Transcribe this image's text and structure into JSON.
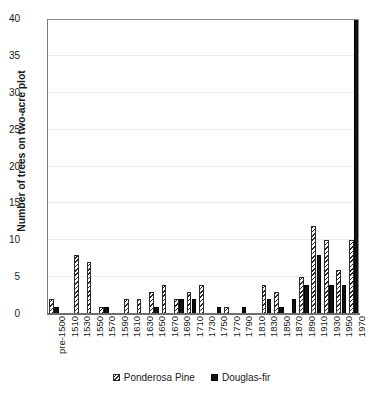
{
  "chart_data": {
    "type": "bar",
    "title": "",
    "xlabel": "",
    "ylabel": "Number of trees on two-acre plot",
    "ylim": [
      0,
      40
    ],
    "yticks": [
      0,
      5,
      10,
      15,
      20,
      25,
      30,
      35,
      40
    ],
    "grid": true,
    "legend_position": "bottom",
    "truncated_note": "Douglas-fir bar at 1970 extends past the top of the 0-40 axis",
    "categories": [
      "pre-1500",
      "1510",
      "1530",
      "1550",
      "1570",
      "1590",
      "1610",
      "1630",
      "1650",
      "1670",
      "1690",
      "1710",
      "1730",
      "1750",
      "1770",
      "1790",
      "1810",
      "1830",
      "1850",
      "1870",
      "1890",
      "1910",
      "1930",
      "1950",
      "1970"
    ],
    "series": [
      {
        "name": "Ponderosa Pine",
        "color": "#2b2b2b",
        "fill": "diagonal-hatch",
        "values": [
          2,
          0,
          8,
          7,
          1,
          0,
          2,
          2,
          3,
          4,
          2,
          3,
          4,
          0,
          1,
          0,
          0,
          4,
          3,
          0,
          5,
          12,
          10,
          6,
          10
        ]
      },
      {
        "name": "Douglas-fir",
        "color": "#111111",
        "fill": "solid",
        "values": [
          1,
          0,
          0,
          0,
          1,
          0,
          0,
          0,
          1,
          0,
          2,
          2,
          0,
          1,
          0,
          1,
          0,
          2,
          1,
          2,
          4,
          8,
          4,
          4,
          42
        ]
      }
    ]
  },
  "legend": {
    "entries": [
      {
        "label": "Ponderosa Pine"
      },
      {
        "label": "Douglas-fir"
      }
    ]
  },
  "axis": {
    "y_title": "Number of trees on two-acre plot"
  }
}
